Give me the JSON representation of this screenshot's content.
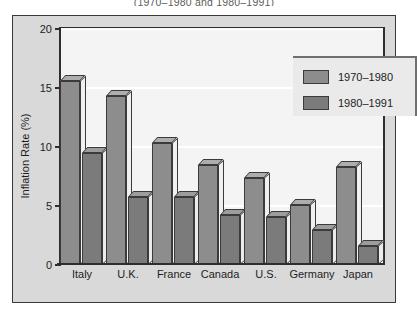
{
  "chart_data": {
    "type": "bar",
    "title": "(1970–1980 and 1980–1991)",
    "xlabel": "",
    "ylabel": "Inflation Rate (%)",
    "ylim": [
      0,
      20
    ],
    "yticks": [
      0,
      5,
      10,
      15,
      20
    ],
    "ytick_labels": [
      "0",
      "5",
      "10",
      "15",
      "20"
    ],
    "grid": true,
    "legend_position": "top-right",
    "categories": [
      "Italy",
      "U.K.",
      "France",
      "Canada",
      "U.S.",
      "Germany",
      "Japan"
    ],
    "series": [
      {
        "name": "1970–1980",
        "color": "#8d8d8d",
        "values": [
          15.6,
          14.3,
          10.3,
          8.5,
          7.4,
          5.1,
          8.3
        ]
      },
      {
        "name": "1980–1991",
        "color": "#7b7b7b",
        "values": [
          9.5,
          5.8,
          5.8,
          4.2,
          4.1,
          3.0,
          1.6
        ]
      }
    ]
  },
  "legend": {
    "items": [
      {
        "label": "1970–1980"
      },
      {
        "label": "1980–1991"
      }
    ]
  }
}
